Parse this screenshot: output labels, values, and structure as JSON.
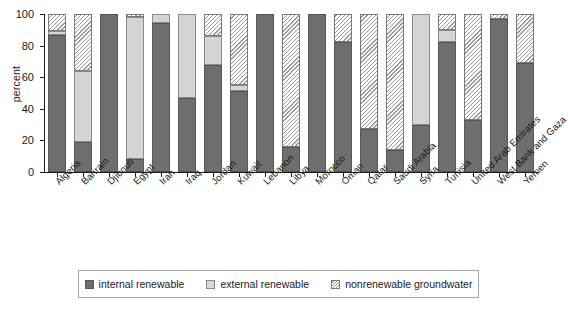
{
  "chart_data": {
    "type": "bar",
    "subtype": "stacked-bar-100",
    "title": "",
    "xlabel": "",
    "ylabel": "percent",
    "ylim": [
      0,
      100
    ],
    "yticks": [
      0,
      20,
      40,
      60,
      80,
      100
    ],
    "grid": false,
    "legend_position": "bottom",
    "categories": [
      "Algeria",
      "Bahrain",
      "Djibouti",
      "Egypt",
      "Iran",
      "Iraq",
      "Jordan",
      "Kuwait",
      "Lebanon",
      "Libya",
      "Morocco",
      "Oman",
      "Qatar",
      "Saudi Arabia",
      "Syria",
      "Tunisia",
      "United Arab Emirates",
      "West Bank and Gaza",
      "Yemen"
    ],
    "series": [
      {
        "name": "internal renewable",
        "color": "#6e6e6e",
        "pattern": "solid-dark",
        "values": [
          87,
          19,
          100,
          8,
          94,
          47,
          68,
          51,
          100,
          16,
          100,
          82,
          27,
          14,
          30,
          82,
          33,
          97,
          69
        ]
      },
      {
        "name": "external renewable",
        "color": "#d4d4d4",
        "pattern": "solid-light",
        "values": [
          2,
          45,
          0,
          90,
          6,
          53,
          18,
          4,
          0,
          0,
          0,
          0,
          0,
          0,
          70,
          8,
          0,
          0,
          0
        ]
      },
      {
        "name": "nonrenewable groundwater",
        "color": "#ffffff",
        "pattern": "diagonal-hatch",
        "values": [
          11,
          36,
          0,
          2,
          0,
          0,
          14,
          45,
          0,
          84,
          0,
          18,
          73,
          86,
          0,
          10,
          67,
          3,
          31
        ]
      }
    ]
  },
  "axis": {
    "y_title": "percent",
    "y_tick_labels": [
      "100",
      "80",
      "60",
      "40",
      "20",
      "0"
    ]
  },
  "legend": {
    "items": [
      {
        "label": "internal renewable",
        "swatch": "solid-dark-swatch"
      },
      {
        "label": "external renewable",
        "swatch": "solid-light-swatch"
      },
      {
        "label": "nonrenewable groundwater",
        "swatch": "hatched-swatch"
      }
    ]
  }
}
